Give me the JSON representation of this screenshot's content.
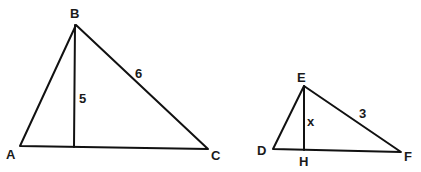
{
  "diagram": {
    "type": "similar-triangles",
    "triangle_large": {
      "vertices": {
        "A": "A",
        "B": "B",
        "C": "C"
      },
      "side_BC_label": "6",
      "altitude_label": "5"
    },
    "triangle_small": {
      "vertices": {
        "D": "D",
        "E": "E",
        "F": "F"
      },
      "foot_label": "H",
      "side_EF_label": "3",
      "altitude_label": "x"
    },
    "colors": {
      "stroke": "#111111",
      "text": "#1a1a1a",
      "background": "#ffffff"
    }
  }
}
